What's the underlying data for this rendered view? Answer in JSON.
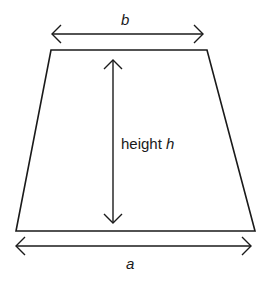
{
  "diagram": {
    "type": "trapezoid",
    "stroke_color": "#1a1a1a",
    "background": "#ffffff",
    "labels": {
      "top_side": "b",
      "bottom_side": "a",
      "height_prefix": "height ",
      "height_var": "h"
    },
    "shape": {
      "top_left": [
        51,
        50
      ],
      "top_right": [
        207,
        50
      ],
      "bottom_right": [
        255,
        231
      ],
      "bottom_left": [
        16,
        231
      ]
    },
    "arrows": [
      {
        "name": "b-dimension",
        "from": [
          52,
          34
        ],
        "to": [
          203,
          34
        ]
      },
      {
        "name": "height-dimension",
        "from": [
          113,
          60
        ],
        "to": [
          113,
          223
        ]
      },
      {
        "name": "a-dimension",
        "from": [
          16,
          246
        ],
        "to": [
          251,
          246
        ]
      }
    ]
  }
}
